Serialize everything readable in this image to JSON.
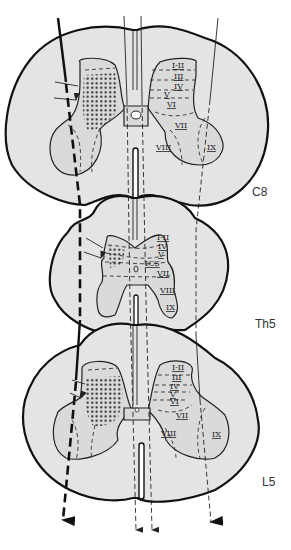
{
  "figure": {
    "colors": {
      "white_matter": "#e4e4e4",
      "gray_matter": "#dadada",
      "outline": "#111111",
      "stipple": "#222222"
    }
  },
  "sections": [
    {
      "label": "C8",
      "laminae": [
        "I-II",
        "III",
        "IV",
        "V",
        "VI",
        "VII",
        "VIII",
        "IX"
      ]
    },
    {
      "label": "Th5",
      "laminae": [
        "I-II",
        "III",
        "IV",
        "V",
        "VI",
        "VII",
        "VIII",
        "IX"
      ],
      "annotation": "ICS"
    },
    {
      "label": "L5",
      "laminae": [
        "I-II",
        "III",
        "IV",
        "V",
        "VI",
        "VII",
        "VIII",
        "IX"
      ]
    }
  ],
  "tracts": [
    {
      "name": "lateral-tract",
      "style": "thick solid to dashed",
      "side": "left"
    },
    {
      "name": "medial-tract-left",
      "style": "thin",
      "side": "midline"
    },
    {
      "name": "medial-tract-right",
      "style": "thin",
      "side": "midline"
    },
    {
      "name": "ventral-tract",
      "style": "thin dashed",
      "side": "right"
    }
  ]
}
